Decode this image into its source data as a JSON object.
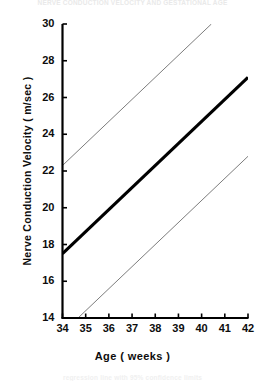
{
  "figure": {
    "bleed_text_top": "NERVE CONDUCTION VELOCITY AND GESTATIONAL AGE",
    "bleed_text_bottom": "regression line with 95% confidence limits"
  },
  "chart_data": {
    "type": "line",
    "title": "",
    "xlabel": "Age ( weeks )",
    "ylabel": "Nerve Conduction Velocity ( m/sec )",
    "xlim": [
      34,
      42
    ],
    "ylim": [
      14,
      30
    ],
    "xticks": [
      34,
      35,
      36,
      37,
      38,
      39,
      40,
      41,
      42
    ],
    "yticks": [
      14,
      16,
      18,
      20,
      22,
      24,
      26,
      28,
      30
    ],
    "xtick_labels": [
      "34",
      "35",
      "36",
      "37",
      "38",
      "39",
      "40",
      "41",
      "42"
    ],
    "ytick_labels": [
      "14",
      "16",
      "18",
      "20",
      "22",
      "24",
      "26",
      "28",
      "30"
    ],
    "grid": false,
    "legend": "none",
    "series": [
      {
        "name": "Regression line",
        "style": "thick-solid",
        "color": "#000000",
        "line_width": 3.2,
        "x": [
          34,
          42
        ],
        "y": [
          17.5,
          27.1
        ],
        "slope": 1.2,
        "intercept": -23.3
      },
      {
        "name": "Upper 95% limit",
        "style": "thin-solid",
        "color": "#6d6d6d",
        "line_width": 0.9,
        "x": [
          34,
          40.42
        ],
        "y": [
          22.3,
          30.0
        ],
        "slope": 1.2,
        "intercept": -18.5
      },
      {
        "name": "Lower 95% limit",
        "style": "thin-solid",
        "color": "#6d6d6d",
        "line_width": 0.9,
        "x": [
          34.67,
          42
        ],
        "y": [
          14.0,
          22.8
        ],
        "slope": 1.2,
        "intercept": -26.8
      }
    ]
  }
}
